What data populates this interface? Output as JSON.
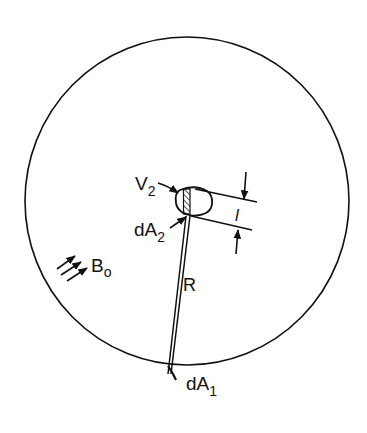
{
  "diagram": {
    "type": "physics-geometry",
    "labels": {
      "v2": "V",
      "v2_sub": "2",
      "da2": "dA",
      "da2_sub": "2",
      "thickness": "l",
      "b0": "B",
      "b0_sub": "o",
      "r": "R",
      "da1": "dA",
      "da1_sub": "1"
    },
    "colors": {
      "stroke": "#111111",
      "background": "#ffffff"
    },
    "circle": {
      "cx": 187,
      "cy": 201,
      "rx": 162,
      "ry": 164
    }
  }
}
